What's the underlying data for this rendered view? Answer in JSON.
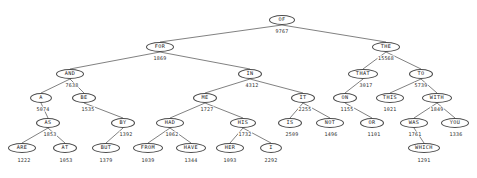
{
  "diagram": {
    "type": "binary-tree",
    "title": "",
    "style": {
      "node_border_color": "#4a4a4a",
      "node_fill_color": "#ffffff",
      "edge_color": "#4a4a4a",
      "text_color": "#1a1a1a"
    },
    "nodes": [
      {
        "id": "of",
        "label": "OF",
        "value": "9767",
        "x": 282,
        "y": 20,
        "w": 26,
        "vx": 282,
        "vy": 31
      },
      {
        "id": "for",
        "label": "FOR",
        "value": "1869",
        "x": 160,
        "y": 47,
        "w": 28,
        "vx": 160,
        "vy": 58
      },
      {
        "id": "the",
        "label": "THE",
        "value": "15568",
        "x": 386,
        "y": 47,
        "w": 28,
        "vx": 386,
        "vy": 58
      },
      {
        "id": "and",
        "label": "AND",
        "value": "7638",
        "x": 70,
        "y": 74,
        "w": 28,
        "vx": 72,
        "vy": 85
      },
      {
        "id": "in",
        "label": "IN",
        "value": "4312",
        "x": 250,
        "y": 74,
        "w": 24,
        "vx": 252,
        "vy": 85
      },
      {
        "id": "that",
        "label": "THAT",
        "value": "3017",
        "x": 363,
        "y": 74,
        "w": 30,
        "vx": 366,
        "vy": 85
      },
      {
        "id": "to",
        "label": "TO",
        "value": "5739",
        "x": 421,
        "y": 74,
        "w": 24,
        "vx": 421,
        "vy": 85
      },
      {
        "id": "a",
        "label": "A",
        "value": "5074",
        "x": 41,
        "y": 98,
        "w": 22,
        "vx": 43,
        "vy": 109
      },
      {
        "id": "be",
        "label": "BE",
        "value": "1535",
        "x": 84,
        "y": 98,
        "w": 24,
        "vx": 88,
        "vy": 109
      },
      {
        "id": "me",
        "label": "ME",
        "value": "1727",
        "x": 205,
        "y": 98,
        "w": 24,
        "vx": 207,
        "vy": 109
      },
      {
        "id": "it",
        "label": "IT",
        "value": "2255",
        "x": 303,
        "y": 98,
        "w": 24,
        "vx": 305,
        "vy": 109
      },
      {
        "id": "on",
        "label": "ON",
        "value": "1155",
        "x": 345,
        "y": 98,
        "w": 24,
        "vx": 347,
        "vy": 109
      },
      {
        "id": "this",
        "label": "THIS",
        "value": "1021",
        "x": 390,
        "y": 98,
        "w": 28,
        "vx": 390,
        "vy": 109
      },
      {
        "id": "with",
        "label": "WITH",
        "value": "1849",
        "x": 437,
        "y": 98,
        "w": 30,
        "vx": 437,
        "vy": 109
      },
      {
        "id": "as",
        "label": "AS",
        "value": "1853",
        "x": 48,
        "y": 123,
        "w": 24,
        "vx": 50,
        "vy": 134
      },
      {
        "id": "by",
        "label": "BY",
        "value": "1392",
        "x": 123,
        "y": 123,
        "w": 24,
        "vx": 126,
        "vy": 134
      },
      {
        "id": "had",
        "label": "HAD",
        "value": "1062",
        "x": 170,
        "y": 123,
        "w": 28,
        "vx": 172,
        "vy": 134
      },
      {
        "id": "his",
        "label": "HIS",
        "value": "1732",
        "x": 243,
        "y": 123,
        "w": 26,
        "vx": 245,
        "vy": 134
      },
      {
        "id": "is",
        "label": "IS",
        "value": "2509",
        "x": 290,
        "y": 123,
        "w": 24,
        "vx": 292,
        "vy": 134
      },
      {
        "id": "not",
        "label": "NOT",
        "value": "1496",
        "x": 330,
        "y": 123,
        "w": 28,
        "vx": 331,
        "vy": 134
      },
      {
        "id": "or",
        "label": "OR",
        "value": "1101",
        "x": 372,
        "y": 123,
        "w": 24,
        "vx": 374,
        "vy": 134
      },
      {
        "id": "was",
        "label": "WAS",
        "value": "1761",
        "x": 414,
        "y": 123,
        "w": 28,
        "vx": 415,
        "vy": 134
      },
      {
        "id": "you",
        "label": "YOU",
        "value": "1336",
        "x": 455,
        "y": 123,
        "w": 28,
        "vx": 456,
        "vy": 134
      },
      {
        "id": "are",
        "label": "ARE",
        "value": "1222",
        "x": 22,
        "y": 148,
        "w": 28,
        "vx": 24,
        "vy": 160
      },
      {
        "id": "at",
        "label": "AT",
        "value": "1053",
        "x": 65,
        "y": 148,
        "w": 24,
        "vx": 66,
        "vy": 160
      },
      {
        "id": "but",
        "label": "BUT",
        "value": "1379",
        "x": 106,
        "y": 148,
        "w": 28,
        "vx": 106,
        "vy": 160
      },
      {
        "id": "from",
        "label": "FROM",
        "value": "1039",
        "x": 148,
        "y": 148,
        "w": 30,
        "vx": 148,
        "vy": 160
      },
      {
        "id": "have",
        "label": "HAVE",
        "value": "1344",
        "x": 191,
        "y": 148,
        "w": 30,
        "vx": 191,
        "vy": 160
      },
      {
        "id": "her",
        "label": "HER",
        "value": "1093",
        "x": 230,
        "y": 148,
        "w": 28,
        "vx": 230,
        "vy": 160
      },
      {
        "id": "i",
        "label": "I",
        "value": "2292",
        "x": 271,
        "y": 148,
        "w": 22,
        "vx": 271,
        "vy": 160
      },
      {
        "id": "which",
        "label": "WHICH",
        "value": "1291",
        "x": 424,
        "y": 148,
        "w": 32,
        "vx": 424,
        "vy": 160
      }
    ],
    "edges": [
      {
        "from": "of",
        "to": "for"
      },
      {
        "from": "of",
        "to": "the"
      },
      {
        "from": "for",
        "to": "and"
      },
      {
        "from": "for",
        "to": "in"
      },
      {
        "from": "the",
        "to": "that"
      },
      {
        "from": "the",
        "to": "to"
      },
      {
        "from": "and",
        "to": "a"
      },
      {
        "from": "and",
        "to": "be"
      },
      {
        "from": "in",
        "to": "me"
      },
      {
        "from": "in",
        "to": "it"
      },
      {
        "from": "that",
        "to": "on"
      },
      {
        "from": "to",
        "to": "this"
      },
      {
        "from": "to",
        "to": "with"
      },
      {
        "from": "a",
        "to": "as"
      },
      {
        "from": "be",
        "to": "by"
      },
      {
        "from": "me",
        "to": "had"
      },
      {
        "from": "me",
        "to": "his"
      },
      {
        "from": "it",
        "to": "is"
      },
      {
        "from": "it",
        "to": "not"
      },
      {
        "from": "on",
        "to": "or"
      },
      {
        "from": "with",
        "to": "was"
      },
      {
        "from": "with",
        "to": "you"
      },
      {
        "from": "as",
        "to": "are"
      },
      {
        "from": "as",
        "to": "at"
      },
      {
        "from": "by",
        "to": "but"
      },
      {
        "from": "had",
        "to": "from"
      },
      {
        "from": "had",
        "to": "have"
      },
      {
        "from": "his",
        "to": "her"
      },
      {
        "from": "his",
        "to": "i"
      },
      {
        "from": "was",
        "to": "which"
      }
    ]
  }
}
